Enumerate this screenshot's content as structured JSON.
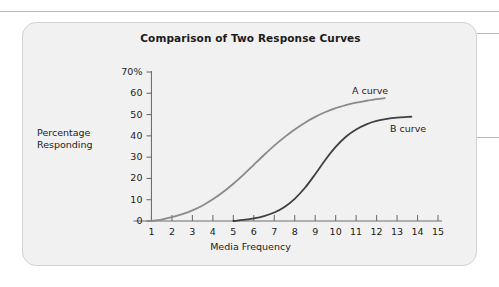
{
  "figure": {
    "title": "Comparison of Two Response Curves",
    "panel_background": "#f1f1f1",
    "panel_border": "#d2d2d2"
  },
  "chart_data": {
    "type": "line",
    "title": "Comparison of Two Response Curves",
    "xlabel": "Media Frequency",
    "ylabel": "Percentage Responding",
    "ylabel_lines": [
      "Percentage",
      "Responding"
    ],
    "xlim": [
      0,
      15
    ],
    "ylim": [
      0,
      70
    ],
    "grid": false,
    "legend_position": "inline-right-of-curve",
    "xticks": [
      1,
      2,
      3,
      4,
      5,
      6,
      7,
      8,
      9,
      10,
      11,
      12,
      13,
      14,
      15
    ],
    "xtick_labels": [
      "1",
      "2",
      "3",
      "4",
      "5",
      "6",
      "7",
      "8",
      "9",
      "10",
      "11",
      "12",
      "13",
      "14",
      "15"
    ],
    "yticks": [
      0,
      10,
      20,
      30,
      40,
      50,
      60,
      70
    ],
    "ytick_labels": [
      "0",
      "10",
      "20",
      "30",
      "40",
      "50",
      "60",
      "70%"
    ],
    "series": [
      {
        "name": "A curve",
        "label": "A curve",
        "color": "#8a8a8a",
        "linewidth": 1.8,
        "x": [
          1,
          1.5,
          2,
          2.5,
          3,
          3.5,
          4,
          4.5,
          5,
          5.5,
          6,
          6.5,
          7,
          7.5,
          8,
          8.5,
          9,
          9.5,
          10,
          10.5,
          11,
          11.5,
          12,
          12.4
        ],
        "values": [
          0,
          0.7,
          1.8,
          3.2,
          5.0,
          7.3,
          10.2,
          13.6,
          17.5,
          21.8,
          26.4,
          31.0,
          35.4,
          39.4,
          43.0,
          46.2,
          48.9,
          51.2,
          53.0,
          54.4,
          55.6,
          56.5,
          57.3,
          57.7
        ]
      },
      {
        "name": "B curve",
        "label": "B curve",
        "color": "#404040",
        "linewidth": 1.8,
        "x": [
          5,
          5.5,
          6,
          6.5,
          7,
          7.5,
          8,
          8.5,
          9,
          9.5,
          10,
          10.5,
          11,
          11.5,
          12,
          12.5,
          13,
          13.5,
          13.7
        ],
        "values": [
          0,
          0.5,
          1.2,
          2.3,
          4.0,
          6.6,
          10.4,
          15.6,
          22.0,
          28.8,
          34.8,
          39.6,
          43.0,
          45.4,
          47.0,
          48.0,
          48.6,
          48.9,
          49.0
        ]
      }
    ]
  }
}
